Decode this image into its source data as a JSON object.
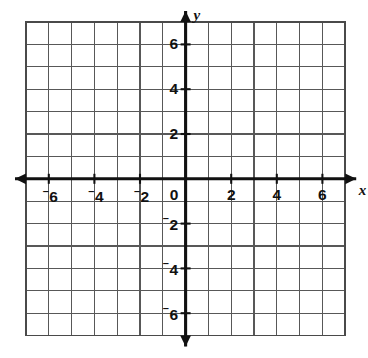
{
  "figure": {
    "kind": "cartesian-coordinate-plane",
    "background_color": "#ffffff"
  },
  "chart_data": {
    "type": "scatter",
    "title": "",
    "subtitle": "",
    "xlabel": "x",
    "ylabel": "y",
    "xlim": [
      -7,
      7
    ],
    "ylim": [
      -7,
      7
    ],
    "grid": true,
    "grid_spacing": 1,
    "grid_columns": 14,
    "grid_rows": 14,
    "legend": "none",
    "series": [],
    "x_tick_values": [
      -6,
      -4,
      -2,
      0,
      2,
      4,
      6
    ],
    "y_tick_values": [
      6,
      4,
      2,
      -2,
      -4,
      -6
    ],
    "x_tick_labels": [
      "⁻6",
      "⁻4",
      "⁻2",
      "0",
      "2",
      "4",
      "6"
    ],
    "y_tick_labels": [
      "6",
      "4",
      "2",
      "⁻2",
      "⁻4",
      "⁻6"
    ],
    "annotations": []
  },
  "axes": {
    "x_axis": {
      "name": "x",
      "label_text": "x",
      "arrow_left": true,
      "arrow_right": true,
      "color": "#111111"
    },
    "y_axis": {
      "name": "y",
      "label_text": "y",
      "arrow_up": true,
      "arrow_down": true,
      "color": "#111111"
    },
    "origin_label": "0"
  },
  "x_ticks": [
    {
      "value": -6,
      "sign": "−",
      "digits": "6",
      "negative": true
    },
    {
      "value": -4,
      "sign": "−",
      "digits": "4",
      "negative": true
    },
    {
      "value": -2,
      "sign": "−",
      "digits": "2",
      "negative": true
    },
    {
      "value": 2,
      "sign": "",
      "digits": "2",
      "negative": false
    },
    {
      "value": 4,
      "sign": "",
      "digits": "4",
      "negative": false
    },
    {
      "value": 6,
      "sign": "",
      "digits": "6",
      "negative": false
    }
  ],
  "y_ticks": [
    {
      "value": 6,
      "sign": "",
      "digits": "6",
      "negative": false
    },
    {
      "value": 4,
      "sign": "",
      "digits": "4",
      "negative": false
    },
    {
      "value": 2,
      "sign": "",
      "digits": "2",
      "negative": false
    },
    {
      "value": -2,
      "sign": "−",
      "digits": "2",
      "negative": true
    },
    {
      "value": -4,
      "sign": "−",
      "digits": "4",
      "negative": true
    },
    {
      "value": -6,
      "sign": "−",
      "digits": "6",
      "negative": true
    }
  ],
  "colors": {
    "grid_line": "#585858",
    "grid_border": "#4a4a4a",
    "axis": "#111111",
    "text": "#111111",
    "background": "#ffffff"
  }
}
